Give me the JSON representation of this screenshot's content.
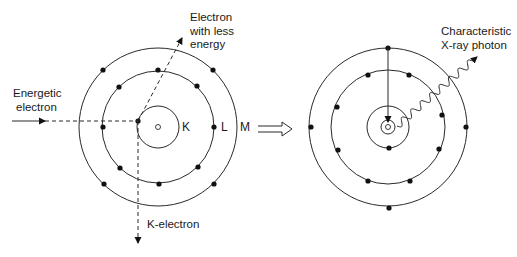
{
  "diagram": {
    "title": "",
    "colors": {
      "line": "#2a2a2a",
      "electron": "#111111",
      "background": "#ffffff"
    },
    "left_atom": {
      "center": [
        158,
        127
      ],
      "nucleus_radius": 2.5,
      "shells": [
        {
          "name": "K",
          "radius": 21
        },
        {
          "name": "L",
          "radius": 56
        },
        {
          "name": "M",
          "radius": 79
        }
      ],
      "shell_labels": {
        "K": "K",
        "L": "L",
        "M": "M"
      },
      "electrons": [
        [
          138,
          121
        ],
        [
          158,
          70
        ],
        [
          119,
          87
        ],
        [
          197,
          86
        ],
        [
          103,
          127
        ],
        [
          214,
          127
        ],
        [
          120,
          168
        ],
        [
          198,
          167
        ],
        [
          159,
          184
        ],
        [
          103,
          70
        ],
        [
          213,
          70
        ],
        [
          104,
          184
        ],
        [
          214,
          184
        ]
      ]
    },
    "right_atom": {
      "center": [
        388,
        127
      ],
      "nucleus_radius": 2.5,
      "shells": [
        {
          "name": "vacancy-ring",
          "radius": 7
        },
        {
          "name": "K",
          "radius": 21
        },
        {
          "name": "L",
          "radius": 57
        },
        {
          "name": "M",
          "radius": 79
        }
      ],
      "electrons": [
        [
          389,
          148
        ],
        [
          368,
          75
        ],
        [
          409,
          75
        ],
        [
          337,
          107
        ],
        [
          442,
          115
        ],
        [
          338,
          150
        ],
        [
          439,
          149
        ],
        [
          368,
          181
        ],
        [
          410,
          181
        ],
        [
          388,
          48
        ],
        [
          311,
          127
        ],
        [
          466,
          127
        ],
        [
          389,
          208
        ]
      ]
    },
    "labels": {
      "energetic_electron": [
        "Energetic",
        "electron"
      ],
      "electron_less_energy": [
        "Electron",
        "with less",
        "energy"
      ],
      "k_electron": "K-electron",
      "characteristic_xray": [
        "Characteristic",
        "X-ray photon"
      ]
    },
    "arrows": {
      "incoming": {
        "from": [
          12,
          121
        ],
        "solid_to": [
          45,
          121
        ],
        "dashed_to": [
          138,
          121
        ]
      },
      "scattered": {
        "from": [
          138,
          121
        ],
        "to": [
          182,
          38
        ]
      },
      "ejected": {
        "from": [
          138,
          121
        ],
        "to": [
          138,
          243
        ]
      },
      "transition": {
        "from": [
          388,
          48
        ],
        "to": [
          388,
          122
        ]
      },
      "photon": {
        "from": [
          397,
          126
        ],
        "to": [
          477,
          57
        ],
        "waves": 8,
        "amplitude": 3.5
      },
      "process": {
        "from": [
          258,
          129
        ],
        "to": [
          292,
          129
        ]
      }
    }
  }
}
